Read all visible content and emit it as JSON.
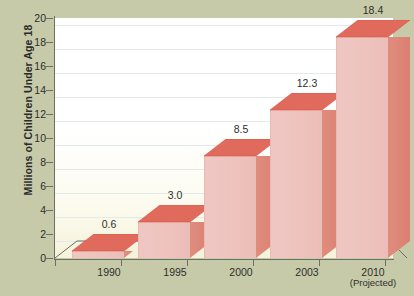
{
  "chart_data": {
    "type": "bar",
    "title": "",
    "subtitle": "",
    "xlabel": "",
    "ylabel": "Millions of Children Under Age 18",
    "categories": [
      "1990",
      "1995",
      "2000",
      "2003",
      "2010"
    ],
    "category_sublabels": [
      "",
      "",
      "",
      "",
      "(Projected)"
    ],
    "values": [
      0.6,
      3.0,
      8.5,
      12.3,
      18.4
    ],
    "data_labels": [
      "0.6",
      "3.0",
      "8.5",
      "12.3",
      "18.4"
    ],
    "ylim": [
      0,
      20
    ],
    "ytick_values": [
      0,
      2,
      4,
      6,
      8,
      10,
      12,
      14,
      16,
      18,
      20
    ],
    "ytick_labels": [
      "0",
      "2",
      "4",
      "6",
      "8",
      "10",
      "12",
      "14",
      "16",
      "18",
      "20"
    ],
    "grid": true,
    "legend": "none",
    "style": "3d-column",
    "colors": {
      "background": "#c6caa8",
      "plot_background": "#ffffff",
      "plot_background_bottom": "#f5f2da",
      "bar_front": "#eec3be",
      "bar_side": "#dd8576",
      "bar_top": "#e06354",
      "gridline": "#e2eaec",
      "axis": "#6e6f63",
      "text": "#2e2e2b"
    }
  },
  "axis": {
    "y_title": "Millions of Children Under Age 18"
  }
}
